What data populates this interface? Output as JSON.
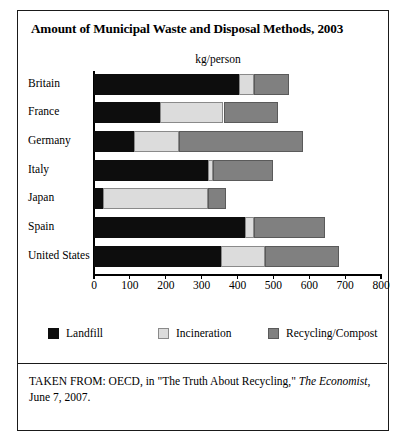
{
  "figure": {
    "title": "Amount of Municipal Waste and Disposal Methods, 2003",
    "unit_label": "kg/person",
    "source_line1_pre": "TAKEN FROM: OECD, in \"The Truth About Recycling,\" ",
    "source_italic": "The Economist",
    "source_line1_post": ",",
    "source_line2": "June 7, 2007."
  },
  "chart_data": {
    "type": "bar",
    "orientation": "horizontal",
    "stacked": true,
    "title": "Amount of Municipal Waste and Disposal Methods, 2003",
    "xlabel": "kg/person",
    "ylabel": "",
    "xlim": [
      0,
      800
    ],
    "xticks": [
      0,
      100,
      200,
      300,
      400,
      500,
      600,
      700,
      800
    ],
    "xtick_labels": [
      "0",
      "100",
      "200",
      "300",
      "400",
      "500",
      "600",
      "700",
      "800"
    ],
    "grid": false,
    "legend_position": "bottom",
    "categories": [
      "Britain",
      "France",
      "Germany",
      "Italy",
      "Japan",
      "Spain",
      "United States"
    ],
    "series": [
      {
        "name": "Landfill",
        "color": "#0d0d0d",
        "values": [
          403,
          185,
          112,
          319,
          25,
          422,
          353
        ]
      },
      {
        "name": "Incineration",
        "color": "#dcdcdc",
        "values": [
          42,
          176,
          126,
          14,
          294,
          23,
          123
        ]
      },
      {
        "name": "Recycling/Compost",
        "color": "#808080",
        "values": [
          98,
          151,
          344,
          165,
          50,
          200,
          207
        ]
      }
    ],
    "totals": [
      543,
      512,
      582,
      498,
      369,
      645,
      683
    ]
  },
  "legend": {
    "items": [
      {
        "label": "Landfill",
        "swatch": "landfill"
      },
      {
        "label": "Incineration",
        "swatch": "incineration"
      },
      {
        "label": "Recycling/Compost",
        "swatch": "recycling"
      }
    ]
  }
}
